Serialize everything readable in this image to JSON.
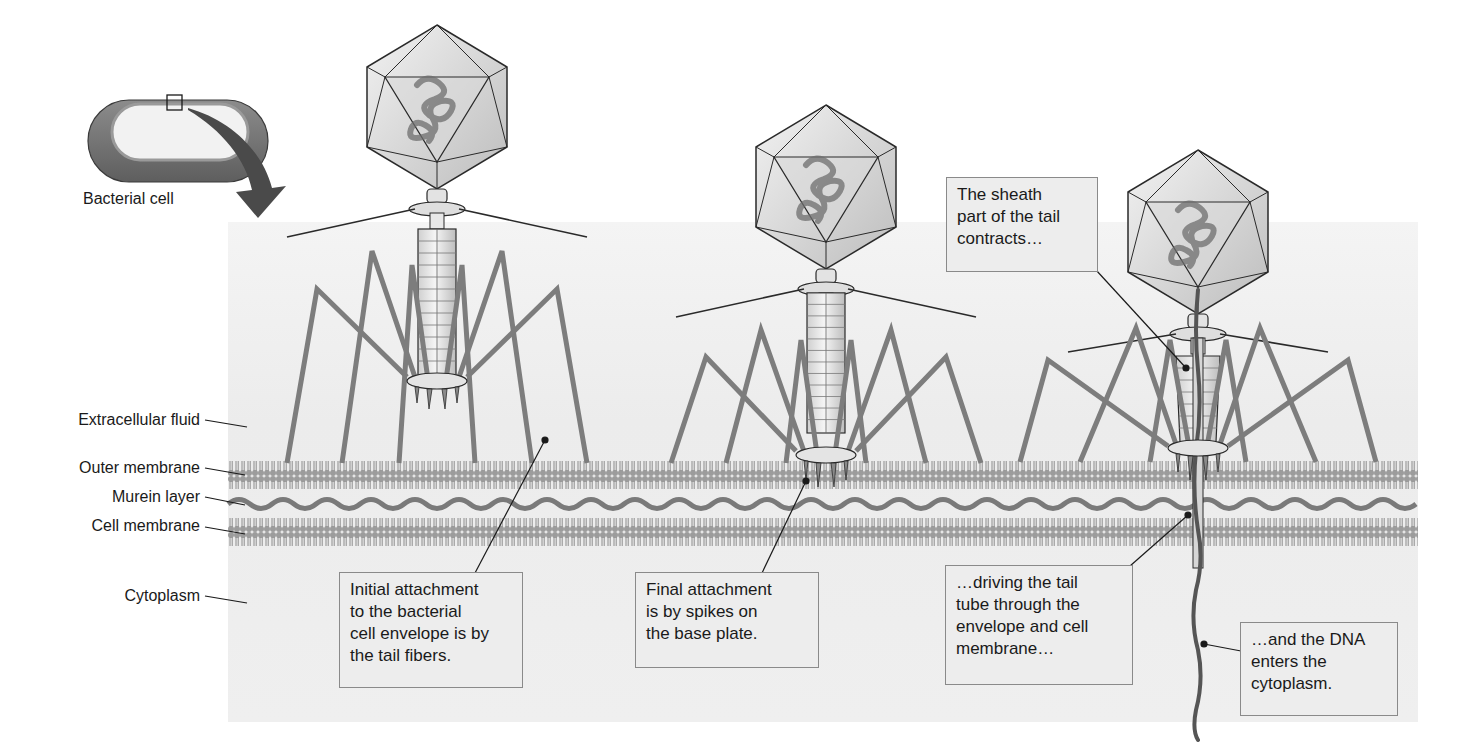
{
  "diagram": {
    "inset": {
      "caption": "Bacterial cell"
    },
    "layers": [
      {
        "label": "Extracellular fluid"
      },
      {
        "label": "Outer membrane"
      },
      {
        "label": "Murein layer"
      },
      {
        "label": "Cell membrane"
      },
      {
        "label": "Cytoplasm"
      }
    ],
    "callouts": [
      {
        "lines": [
          "Initial attachment",
          "to the bacterial",
          "cell envelope is by",
          "the tail fibers."
        ]
      },
      {
        "lines": [
          "Final attachment",
          "is by spikes on",
          "the base plate."
        ]
      },
      {
        "lines": [
          "The sheath",
          "part of the tail",
          "contracts…"
        ]
      },
      {
        "lines": [
          "…driving the tail",
          "tube through the",
          "envelope and cell",
          "membrane…"
        ]
      },
      {
        "lines": [
          "…and the DNA",
          "enters the",
          "cytoplasm."
        ]
      }
    ],
    "colors": {
      "panel": "#efefef",
      "membrane": "#9a9a9a",
      "murein": "#7a7a7a",
      "fiber": "#7d7d7d",
      "outline": "#2a2a2a",
      "callout_bg": "#ededed",
      "callout_border": "#8a8a8a"
    }
  }
}
